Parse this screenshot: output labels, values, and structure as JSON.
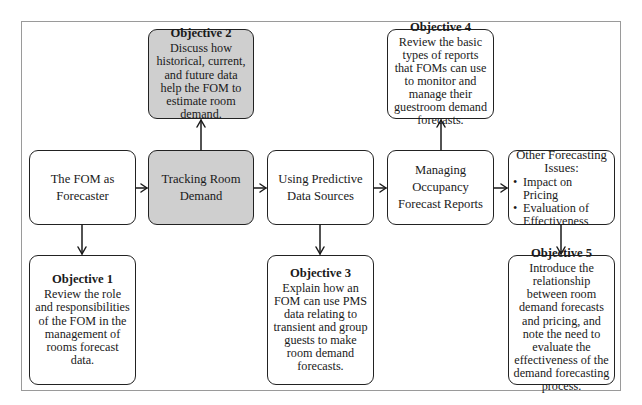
{
  "diagram": {
    "type": "flowchart",
    "topics": [
      {
        "id": "t1",
        "label": "The FOM as Forecaster",
        "lines": [
          "The FOM as",
          "Forecaster"
        ],
        "highlighted": false
      },
      {
        "id": "t2",
        "label": "Tracking Room Demand",
        "lines": [
          "Tracking Room",
          "Demand"
        ],
        "highlighted": true
      },
      {
        "id": "t3",
        "label": "Using Predictive Data Sources",
        "lines": [
          "Using Predictive",
          "Data Sources"
        ],
        "highlighted": false
      },
      {
        "id": "t4",
        "label": "Managing Occupancy Forecast Reports",
        "lines": [
          "Managing Occupancy",
          "Forecast Reports"
        ],
        "highlighted": false
      },
      {
        "id": "t5",
        "label": "Other Forecasting Issues:",
        "lines": [
          "Other Forecasting",
          "Issues:"
        ],
        "bullets": [
          "Impact on Pricing",
          "Evaluation of Effectiveness"
        ],
        "highlighted": false
      }
    ],
    "objectives": [
      {
        "id": "o1",
        "title": "Objective 1",
        "text": "Review the role and responsibilities of the FOM in the management of rooms forecast data.",
        "linked_topic": "t1",
        "position": "below",
        "highlighted": false
      },
      {
        "id": "o2",
        "title": "Objective 2",
        "text": "Discuss how historical, current, and future data help the FOM to estimate room demand.",
        "linked_topic": "t2",
        "position": "above",
        "highlighted": true
      },
      {
        "id": "o3",
        "title": "Objective 3",
        "text": "Explain how an FOM can use PMS data relating to transient and group guests to make room demand forecasts.",
        "linked_topic": "t3",
        "position": "below",
        "highlighted": false
      },
      {
        "id": "o4",
        "title": "Objective 4",
        "text": "Review the basic types of reports that FOMs can use to monitor and manage their guestroom demand forecasts.",
        "linked_topic": "t4",
        "position": "above",
        "highlighted": false
      },
      {
        "id": "o5",
        "title": "Objective 5",
        "text": "Introduce the relationship between room demand forecasts and pricing, and note the need to evaluate the effectiveness of the demand forecasting process.",
        "linked_topic": "t5",
        "position": "below",
        "highlighted": false
      }
    ],
    "edges": [
      {
        "from": "t1",
        "to": "t2"
      },
      {
        "from": "t2",
        "to": "t3"
      },
      {
        "from": "t3",
        "to": "t4"
      },
      {
        "from": "t4",
        "to": "t5"
      },
      {
        "from": "t1",
        "to": "o1"
      },
      {
        "from": "t2",
        "to": "o2"
      },
      {
        "from": "t3",
        "to": "o3"
      },
      {
        "from": "t4",
        "to": "o4"
      },
      {
        "from": "t5",
        "to": "o5"
      }
    ],
    "colors": {
      "highlight_fill": "#cfcfcf",
      "border": "#222222",
      "frame": "#9a9a9a"
    }
  }
}
